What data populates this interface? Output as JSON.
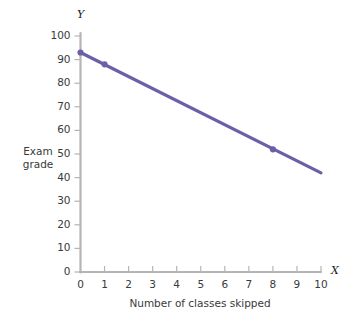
{
  "chart_data": {
    "type": "line",
    "title": "",
    "xlabel": "Number of classes skipped",
    "ylabel": "Exam grade",
    "x_axis_name": "X",
    "y_axis_name": "Y",
    "xlim": [
      0,
      10
    ],
    "ylim": [
      0,
      100
    ],
    "grid": false,
    "legend": null,
    "line_color": "#6b60a8",
    "axis_color": "#b5b5b5",
    "x_ticks": [
      "0",
      "1",
      "2",
      "3",
      "4",
      "5",
      "6",
      "7",
      "8",
      "9",
      "10"
    ],
    "y_ticks": [
      "0",
      "10",
      "20",
      "30",
      "40",
      "50",
      "60",
      "70",
      "80",
      "90",
      "100"
    ],
    "series": [
      {
        "name": "Exam grade vs classes skipped",
        "x": [
          0,
          10
        ],
        "values": [
          93,
          42
        ]
      }
    ],
    "markers": [
      {
        "x": 0,
        "y": 93
      },
      {
        "x": 1,
        "y": 88
      },
      {
        "x": 8,
        "y": 52
      }
    ]
  }
}
